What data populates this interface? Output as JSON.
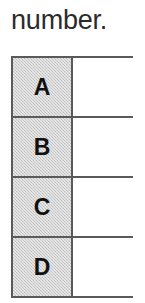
{
  "page": {
    "background_color": "#ffffff",
    "width": 145,
    "height": 303
  },
  "caption": {
    "text": "number.",
    "color": "#2b2b2b"
  },
  "table": {
    "name": "answer-grid",
    "border_color": "#5a5a5a",
    "label_column_fill": "#cdcdcd",
    "value_column_fill": "#ffffff",
    "columns": [
      {
        "key": "label",
        "header": ""
      },
      {
        "key": "value",
        "header": ""
      }
    ],
    "rows": [
      {
        "label": "A",
        "value": ""
      },
      {
        "label": "B",
        "value": ""
      },
      {
        "label": "C",
        "value": ""
      },
      {
        "label": "D",
        "value": ""
      }
    ]
  }
}
